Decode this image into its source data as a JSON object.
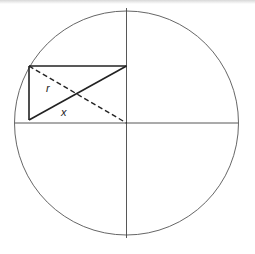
{
  "diagram": {
    "type": "geometry",
    "circle": {
      "cx": 126.5,
      "cy": 123,
      "r": 112
    },
    "axes": {
      "vertical": {
        "x": 126.5,
        "y1": 8,
        "y2": 238
      },
      "horizontal": {
        "y": 123,
        "x1": 15,
        "x2": 238
      }
    },
    "rectangle": {
      "x1": 29,
      "y1": 66,
      "x2": 126.5,
      "y2": 120
    },
    "diagonals": [
      {
        "name": "r",
        "style": "dashed",
        "from": [
          29,
          66
        ],
        "to": [
          126.5,
          123
        ]
      },
      {
        "name": "x",
        "style": "solid",
        "from": [
          29,
          120
        ],
        "to": [
          126.5,
          66
        ]
      }
    ],
    "labels": {
      "r": "r",
      "x": "x"
    },
    "colors": {
      "stroke": "#333333",
      "thin_stroke": "#555555",
      "background": "#ffffff"
    }
  }
}
